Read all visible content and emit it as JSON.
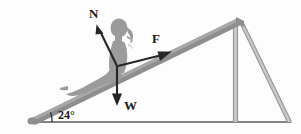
{
  "figure": {
    "background_color": "#fdfdfd",
    "ramp_color": "#8e8e8e",
    "vector_color": "#262626",
    "ground_color": "#5b5b5b",
    "frame_color": "#9a9a9a"
  },
  "angle": {
    "value": "24",
    "degree_symbol": "°",
    "label": "24°",
    "vertex_x": 30,
    "vertex_y": 122
  },
  "forces": [
    {
      "symbol": "N",
      "name": "normal-force",
      "direction": "up-left perpendicular to incline",
      "tail_x": 117,
      "tail_y": 66,
      "tip_x": 97,
      "tip_y": 26,
      "label_x": 95,
      "label_y": 18
    },
    {
      "symbol": "F",
      "name": "applied-force",
      "direction": "up-right along incline",
      "tail_x": 118,
      "tail_y": 65,
      "tip_x": 170,
      "tip_y": 52,
      "label_x": 156,
      "label_y": 42
    },
    {
      "symbol": "W",
      "name": "weight-force",
      "direction": "straight down",
      "tail_x": 117,
      "tail_y": 66,
      "tip_x": 117,
      "tip_y": 104,
      "label_x": 124,
      "label_y": 110
    }
  ],
  "structure": {
    "ramp": {
      "name": "inclined-ramp",
      "bottom_x": 30,
      "bottom_y": 120,
      "top_x": 239,
      "top_y": 20
    },
    "ground": {
      "name": "ground-line",
      "start_x": 28,
      "end_x": 291,
      "y": 122
    },
    "vertical_post": {
      "name": "vertical-support-post",
      "x": 235,
      "top_y": 22,
      "bottom_y": 122
    },
    "diagonal_brace": {
      "name": "diagonal-brace",
      "top_x": 240,
      "top_y": 22,
      "bottom_x": 289,
      "bottom_y": 122
    },
    "person": {
      "name": "person-silhouette",
      "description": "grey silhouette of a person seated on the ramp"
    }
  }
}
